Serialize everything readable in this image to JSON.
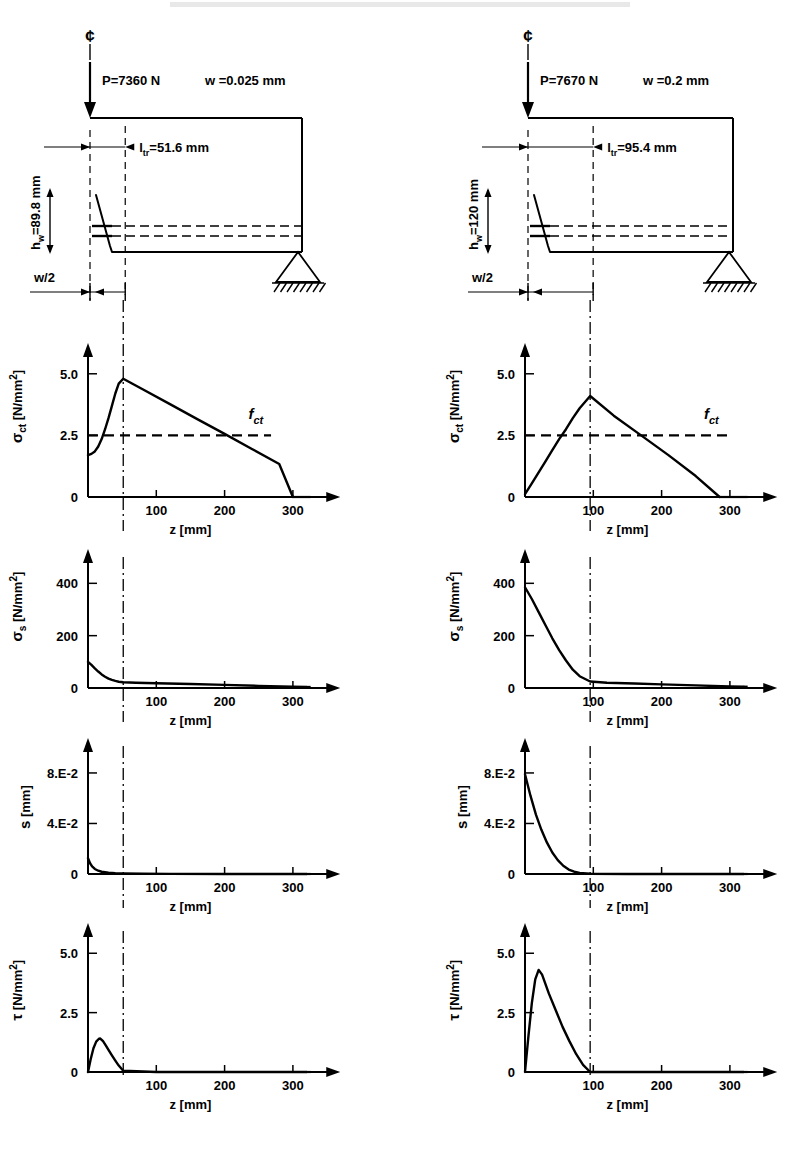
{
  "figure": {
    "header_faint": "",
    "axis_x_label": "z [mm]",
    "x_ticks": [
      "100",
      "200",
      "300"
    ],
    "fct_label": "f",
    "fct_sub": "ct"
  },
  "panels": {
    "left": {
      "name": "left-column",
      "beam": {
        "centerline_symbol": "¢",
        "load_label": "P=7360 N",
        "crack_width_label": "w =0.025 mm",
        "ltr_label_prefix": "l",
        "ltr_label_sub": "tr",
        "ltr_label_value": "=51.6 mm",
        "hw_prefix": "h",
        "hw_sub": "w",
        "hw_value": "=89.8 mm",
        "w_half_label": "w/2",
        "ltr_mm": 51.6
      },
      "charts": [
        {
          "id": "sigma-ct",
          "ylabel_main": "σ",
          "ylabel_sub": "ct",
          "ylabel_unit": "[N/mm",
          "ylabel_exp": "2",
          "ylabel_close": "]",
          "yticks": [
            "0",
            "2.5",
            "5.0"
          ]
        },
        {
          "id": "sigma-s",
          "ylabel_main": "σ",
          "ylabel_sub": "s",
          "ylabel_unit": "[N/mm",
          "ylabel_exp": "2",
          "ylabel_close": "]",
          "yticks": [
            "0",
            "200",
            "400"
          ]
        },
        {
          "id": "slip-s",
          "ylabel_main": "s",
          "ylabel_sub": "",
          "ylabel_unit": "[mm]",
          "ylabel_exp": "",
          "ylabel_close": "",
          "yticks": [
            "0",
            "4.E-2",
            "8.E-2"
          ]
        },
        {
          "id": "tau",
          "ylabel_main": "τ",
          "ylabel_sub": "",
          "ylabel_unit": "[N/mm",
          "ylabel_exp": "2",
          "ylabel_close": "]",
          "yticks": [
            "0",
            "2.5",
            "5.0"
          ]
        }
      ]
    },
    "right": {
      "name": "right-column",
      "beam": {
        "centerline_symbol": "¢",
        "load_label": "P=7670 N",
        "crack_width_label": "w =0.2 mm",
        "ltr_label_prefix": "l",
        "ltr_label_sub": "tr",
        "ltr_label_value": "=95.4 mm",
        "hw_prefix": "h",
        "hw_sub": "w",
        "hw_value": "=120 mm",
        "w_half_label": "w/2",
        "ltr_mm": 95.4
      },
      "charts": [
        {
          "id": "sigma-ct",
          "ylabel_main": "σ",
          "ylabel_sub": "ct",
          "ylabel_unit": "[N/mm",
          "ylabel_exp": "2",
          "ylabel_close": "]",
          "yticks": [
            "0",
            "2.5",
            "5.0"
          ]
        },
        {
          "id": "sigma-s",
          "ylabel_main": "σ",
          "ylabel_sub": "s",
          "ylabel_unit": "[N/mm",
          "ylabel_exp": "2",
          "ylabel_close": "]",
          "yticks": [
            "0",
            "200",
            "400"
          ]
        },
        {
          "id": "slip-s",
          "ylabel_main": "s",
          "ylabel_sub": "",
          "ylabel_unit": "[mm]",
          "ylabel_exp": "",
          "ylabel_close": "",
          "yticks": [
            "0",
            "4.E-2",
            "8.E-2"
          ]
        },
        {
          "id": "tau",
          "ylabel_main": "τ",
          "ylabel_sub": "",
          "ylabel_unit": "[N/mm",
          "ylabel_exp": "2",
          "ylabel_close": "]",
          "yticks": [
            "0",
            "2.5",
            "5.0"
          ]
        }
      ]
    }
  },
  "chart_data": [
    {
      "id": "left-sigma-ct",
      "type": "line",
      "title": "",
      "xlabel": "z [mm]",
      "ylabel": "σct [N/mm2]",
      "xlim": [
        0,
        340
      ],
      "ylim": [
        0,
        5.6
      ],
      "xticks": [
        100,
        200,
        300
      ],
      "yticks": [
        0,
        2.5,
        5.0
      ],
      "grid": false,
      "marker_line_x": 51.6,
      "annotations": [
        {
          "text": "f_ct",
          "y": 2.5,
          "style": "dashed-horizontal",
          "x_start": 0,
          "x_end": 270
        }
      ],
      "x": [
        0,
        5,
        10,
        15,
        20,
        25,
        30,
        35,
        40,
        45,
        51.6,
        80,
        120,
        160,
        200,
        240,
        280,
        300
      ],
      "y": [
        1.7,
        1.75,
        1.85,
        2.05,
        2.35,
        2.75,
        3.2,
        3.7,
        4.2,
        4.6,
        4.8,
        4.37,
        3.77,
        3.16,
        2.56,
        1.95,
        1.34,
        0.0
      ]
    },
    {
      "id": "left-sigma-s",
      "type": "line",
      "xlabel": "z [mm]",
      "ylabel": "σs [N/mm2]",
      "xlim": [
        0,
        340
      ],
      "ylim": [
        0,
        470
      ],
      "xticks": [
        100,
        200,
        300
      ],
      "yticks": [
        0,
        200,
        400
      ],
      "grid": false,
      "marker_line_x": 51.6,
      "x": [
        0,
        5,
        10,
        15,
        20,
        25,
        30,
        35,
        40,
        45,
        51.6,
        70,
        100,
        150,
        200,
        250,
        300,
        320
      ],
      "y": [
        100,
        88,
        75,
        63,
        52,
        43,
        36,
        31,
        27,
        24,
        22,
        20,
        18,
        15,
        12,
        8,
        5,
        4
      ]
    },
    {
      "id": "left-slip-s",
      "type": "line",
      "xlabel": "z [mm]",
      "ylabel": "s [mm]",
      "xlim": [
        0,
        340
      ],
      "ylim": [
        0,
        0.095
      ],
      "xticks": [
        100,
        200,
        300
      ],
      "yticks": [
        0,
        0.04,
        0.08
      ],
      "ytick_labels": [
        "0",
        "4.E-2",
        "8.E-2"
      ],
      "grid": false,
      "marker_line_x": 51.6,
      "x": [
        0,
        3,
        6,
        10,
        15,
        20,
        30,
        40,
        51.6,
        80,
        120,
        200,
        300,
        320
      ],
      "y": [
        0.0125,
        0.0085,
        0.006,
        0.004,
        0.0026,
        0.0018,
        0.001,
        0.0006,
        0.0004,
        0.0002,
        0.0001,
        0.0,
        0.0,
        0.0
      ]
    },
    {
      "id": "left-tau",
      "type": "line",
      "xlabel": "z [mm]",
      "ylabel": "τ [N/mm2]",
      "xlim": [
        0,
        340
      ],
      "ylim": [
        0,
        5.6
      ],
      "xticks": [
        100,
        200,
        300
      ],
      "yticks": [
        0,
        2.5,
        5.0
      ],
      "grid": false,
      "marker_line_x": 51.6,
      "x": [
        0,
        4,
        8,
        12,
        16,
        18,
        22,
        26,
        30,
        35,
        40,
        45,
        51.6,
        100,
        200,
        300,
        320
      ],
      "y": [
        0.0,
        0.55,
        1.0,
        1.28,
        1.4,
        1.41,
        1.3,
        1.12,
        0.93,
        0.7,
        0.48,
        0.27,
        0.05,
        0.0,
        0.0,
        0.0,
        0.0
      ]
    },
    {
      "id": "right-sigma-ct",
      "type": "line",
      "xlabel": "z [mm]",
      "ylabel": "σct [N/mm2]",
      "xlim": [
        0,
        340
      ],
      "ylim": [
        0,
        5.6
      ],
      "xticks": [
        100,
        200,
        300
      ],
      "yticks": [
        0,
        2.5,
        5.0
      ],
      "grid": false,
      "marker_line_x": 95.4,
      "annotations": [
        {
          "text": "f_ct",
          "y": 2.5,
          "style": "dashed-horizontal",
          "x_start": 0,
          "x_end": 300
        }
      ],
      "x": [
        0,
        10,
        20,
        30,
        40,
        50,
        60,
        70,
        80,
        95.4,
        130,
        170,
        210,
        250,
        285
      ],
      "y": [
        0.12,
        0.55,
        1.0,
        1.45,
        1.9,
        2.35,
        2.75,
        3.2,
        3.6,
        4.1,
        3.3,
        2.5,
        1.7,
        0.85,
        0.0
      ]
    },
    {
      "id": "right-sigma-s",
      "type": "line",
      "xlabel": "z [mm]",
      "ylabel": "σs [N/mm2]",
      "xlim": [
        0,
        340
      ],
      "ylim": [
        0,
        470
      ],
      "xticks": [
        100,
        200,
        300
      ],
      "yticks": [
        0,
        200,
        400
      ],
      "grid": false,
      "marker_line_x": 95.4,
      "x": [
        0,
        10,
        20,
        30,
        40,
        50,
        60,
        70,
        80,
        95.4,
        120,
        160,
        200,
        250,
        300,
        320
      ],
      "y": [
        385,
        340,
        290,
        240,
        190,
        145,
        105,
        70,
        45,
        25,
        20,
        17,
        14,
        10,
        6,
        5
      ]
    },
    {
      "id": "right-slip-s",
      "type": "line",
      "xlabel": "z [mm]",
      "ylabel": "s [mm]",
      "xlim": [
        0,
        340
      ],
      "ylim": [
        0,
        0.095
      ],
      "xticks": [
        100,
        200,
        300
      ],
      "yticks": [
        0,
        0.04,
        0.08
      ],
      "ytick_labels": [
        "0",
        "4.E-2",
        "8.E-2"
      ],
      "grid": false,
      "marker_line_x": 95.4,
      "x": [
        0,
        8,
        16,
        24,
        32,
        40,
        48,
        56,
        64,
        72,
        80,
        95.4,
        150,
        250,
        320
      ],
      "y": [
        0.079,
        0.062,
        0.047,
        0.035,
        0.025,
        0.017,
        0.011,
        0.0065,
        0.0035,
        0.0018,
        0.0008,
        0.0002,
        0.0,
        0.0,
        0.0
      ]
    },
    {
      "id": "right-tau",
      "type": "line",
      "xlabel": "z [mm]",
      "ylabel": "τ [N/mm2]",
      "xlim": [
        0,
        340
      ],
      "ylim": [
        0,
        5.6
      ],
      "xticks": [
        100,
        200,
        300
      ],
      "yticks": [
        0,
        2.5,
        5.0
      ],
      "grid": false,
      "marker_line_x": 95.4,
      "x": [
        0,
        5,
        10,
        15,
        20,
        25,
        35,
        45,
        55,
        65,
        75,
        85,
        95.4,
        150,
        250,
        320
      ],
      "y": [
        0.0,
        1.5,
        2.9,
        3.9,
        4.3,
        4.1,
        3.3,
        2.6,
        1.9,
        1.3,
        0.75,
        0.3,
        0.0,
        0.0,
        0.0,
        0.0
      ]
    }
  ]
}
